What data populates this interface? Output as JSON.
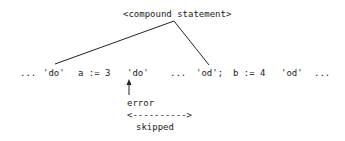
{
  "diagram": {
    "root_label": "<compound statement>",
    "tokens": [
      {
        "text": "...",
        "x": 20
      },
      {
        "text": "'do'",
        "x": 43
      },
      {
        "text": "a := 3",
        "x": 78
      },
      {
        "text": "'do'",
        "x": 128
      },
      {
        "text": "...",
        "x": 170
      },
      {
        "text": "'od';",
        "x": 196
      },
      {
        "text": "b := 4",
        "x": 233
      },
      {
        "text": "'od'",
        "x": 281
      },
      {
        "text": "...",
        "x": 314
      }
    ],
    "error_label": "error",
    "skip_marker": "<---------->",
    "skipped_label": "skipped"
  }
}
